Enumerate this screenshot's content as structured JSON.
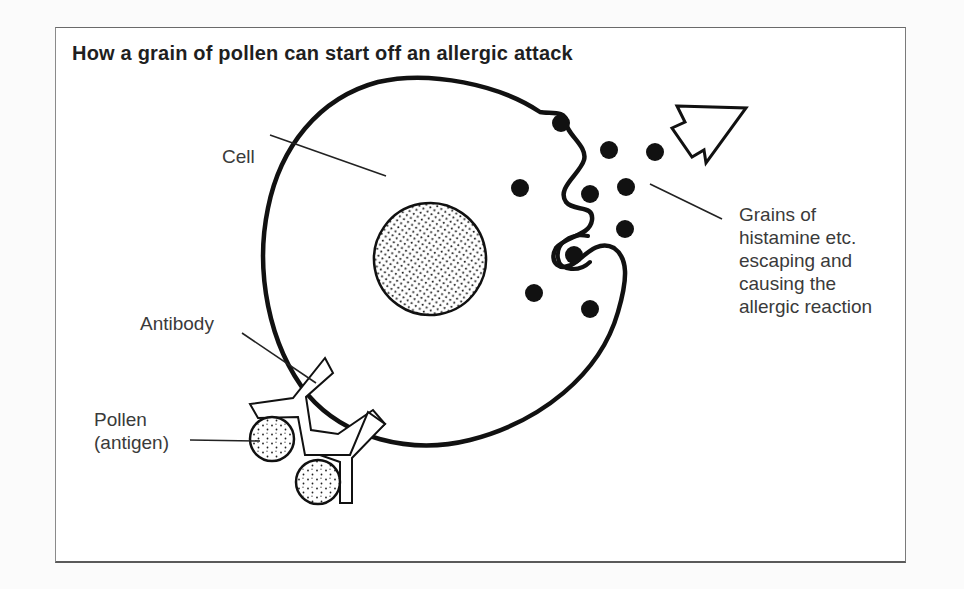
{
  "figure": {
    "title": "How a grain of pollen can start off an allergic attack",
    "labels": {
      "cell": "Cell",
      "antibody": "Antibody",
      "pollen": [
        "Pollen",
        "(antigen)"
      ],
      "histamine": [
        "Grains of",
        "histamine etc.",
        "escaping and",
        "causing the",
        "allergic reaction"
      ]
    },
    "components": {
      "cell": "large cell with thick outline and an indented membrane on the right side",
      "nucleus": "stippled oval nucleus",
      "histamine_grains": 10,
      "pollen_grains": 2,
      "antibodies": 2,
      "arrow": "outlined zig-zag arrow pointing up-right"
    },
    "colors": {
      "ink": "#111111",
      "label_text": "#3a3a3a",
      "title_text": "#1f1f1f",
      "frame": "#6a6a6a",
      "background": "#ffffff"
    }
  }
}
